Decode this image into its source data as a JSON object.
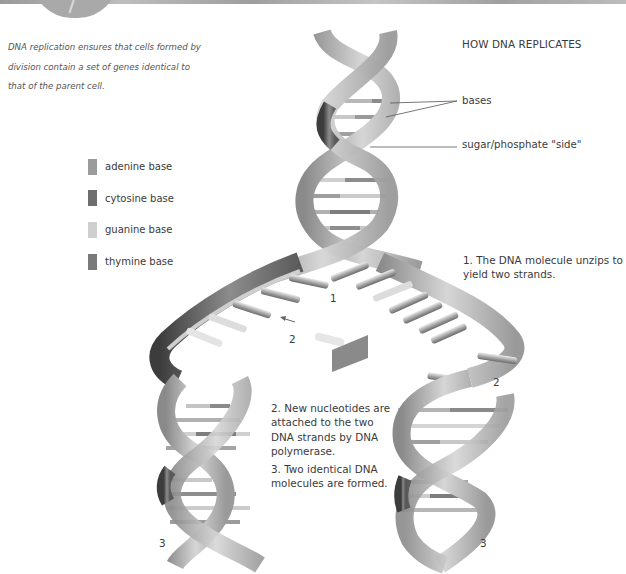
{
  "intro_text": "DNA replication ensures that cells formed by division contain a set of genes identical to that of the parent cell.",
  "title": "HOW DNA REPLICATES",
  "callouts": {
    "bases": "bases",
    "side": "sugar/phosphate \"side\""
  },
  "legend": [
    {
      "label": "adenine base",
      "color": "#9b9b9b"
    },
    {
      "label": "cytosine base",
      "color": "#6e6e6e"
    },
    {
      "label": "guanine base",
      "color": "#cfcfcf"
    },
    {
      "label": "thymine base",
      "color": "#7a7a7a"
    }
  ],
  "steps": [
    {
      "number": "1",
      "text": "1. The DNA molecule unzips to yield two strands."
    },
    {
      "number": "2",
      "text": "2. New nucleotides are attached to the two DNA strands by DNA polymerase."
    },
    {
      "number": "3",
      "text": "3. Two identical DNA molecules are formed."
    }
  ],
  "diagram_markers": {
    "marker_1": "1",
    "marker_2_left": "2",
    "marker_2_right": "2",
    "marker_3_left": "3",
    "marker_3_right": "3"
  }
}
